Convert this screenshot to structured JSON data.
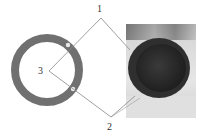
{
  "figure": {
    "type": "pipe cross-section diagram with photo",
    "labels": [
      {
        "id": "1",
        "text": "1"
      },
      {
        "id": "2",
        "text": "2"
      },
      {
        "id": "3",
        "text": "3"
      }
    ],
    "colors": {
      "ring": "#707070",
      "marker_dot": "#e8e8e8",
      "leader_line": "#888888",
      "disc": "#2a2a2a",
      "background": "#ffffff"
    }
  }
}
